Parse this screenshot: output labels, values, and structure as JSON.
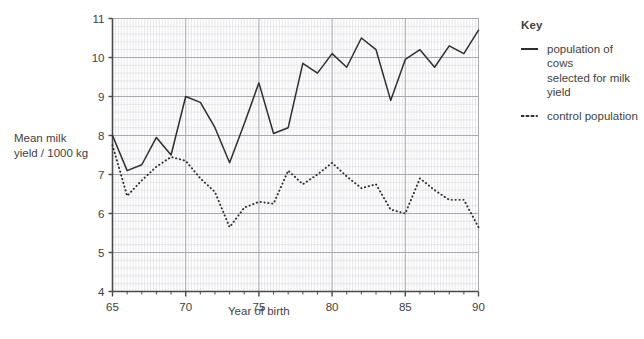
{
  "axes": {
    "ylabel_line1": "Mean milk",
    "ylabel_line2": "yield / 1000 kg",
    "xlabel": "Year of birth"
  },
  "key": {
    "title": "Key",
    "items": [
      {
        "style": "solid",
        "label_line1": "population of cows",
        "label_line2": "selected for milk yield"
      },
      {
        "style": "dotted",
        "label_line1": "control population",
        "label_line2": ""
      }
    ]
  },
  "colors": {
    "line": "#2e2e2e",
    "grid_minor": "#d8d8dd",
    "grid_major": "#a9a9b0",
    "axis": "#4a4a4a",
    "text": "#3f3f3f"
  },
  "chart_data": {
    "type": "line",
    "title": "",
    "xlabel": "Year of birth",
    "ylabel": "Mean milk yield / 1000 kg",
    "xlim": [
      65,
      90
    ],
    "ylim": [
      4,
      11
    ],
    "xticks": [
      65,
      70,
      75,
      80,
      85,
      90
    ],
    "yticks": [
      4,
      5,
      6,
      7,
      8,
      9,
      10,
      11
    ],
    "grid": true,
    "grid_minor_x_per_unit": 5,
    "grid_minor_y_per_unit": 5,
    "legend_position": "right",
    "x": [
      65,
      66,
      67,
      68,
      69,
      70,
      71,
      72,
      73,
      74,
      75,
      76,
      77,
      78,
      79,
      80,
      81,
      82,
      83,
      84,
      85,
      86,
      87,
      88,
      89,
      90
    ],
    "series": [
      {
        "name": "population of cows selected for milk yield",
        "style": "solid",
        "values": [
          8.0,
          7.1,
          7.25,
          7.95,
          7.5,
          9.0,
          8.85,
          8.2,
          7.3,
          8.3,
          9.35,
          8.05,
          8.2,
          9.85,
          9.6,
          10.1,
          9.75,
          10.5,
          10.2,
          8.9,
          9.95,
          10.2,
          9.75,
          10.3,
          10.1,
          10.7
        ]
      },
      {
        "name": "control population",
        "style": "dotted",
        "values": [
          7.75,
          6.45,
          6.85,
          7.2,
          7.45,
          7.35,
          6.9,
          6.55,
          5.65,
          6.15,
          6.3,
          6.25,
          7.1,
          6.75,
          7.0,
          7.3,
          6.95,
          6.65,
          6.75,
          6.1,
          6.0,
          6.9,
          6.6,
          6.35,
          6.35,
          5.65
        ]
      }
    ]
  }
}
